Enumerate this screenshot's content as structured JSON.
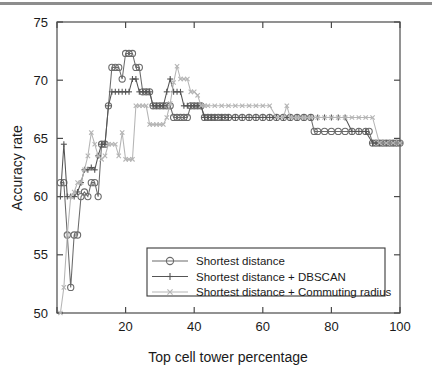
{
  "figure": {
    "background_color": "#ffffff",
    "top_rule_color": "#8d8d8d",
    "axis_color": "#4a4a4a"
  },
  "chart_data": {
    "type": "line",
    "title": "",
    "subtitle": "",
    "xlabel": "Top cell tower percentage",
    "ylabel": "Accuracy rate",
    "xlim": [
      0,
      100
    ],
    "ylim": [
      50,
      75
    ],
    "xticks": [
      0,
      20,
      40,
      60,
      80,
      100
    ],
    "xtick_labels": [
      "",
      "20",
      "40",
      "60",
      "80",
      "100"
    ],
    "yticks": [
      50,
      55,
      60,
      65,
      70,
      75
    ],
    "ytick_labels": [
      "50",
      "55",
      "60",
      "65",
      "70",
      "75"
    ],
    "grid": false,
    "legend_position": "lower center",
    "series": [
      {
        "name": "Shortest distance",
        "marker": "circle",
        "color": "#6b6b6b",
        "x": [
          1,
          2,
          3,
          4,
          5,
          6,
          7,
          8,
          9,
          10,
          11,
          12,
          13,
          14,
          15,
          16,
          17,
          18,
          19,
          20,
          21,
          22,
          23,
          24,
          25,
          26,
          27,
          28,
          29,
          30,
          31,
          32,
          33,
          34,
          35,
          36,
          37,
          38,
          39,
          40,
          41,
          42,
          43,
          44,
          45,
          46,
          47,
          48,
          49,
          50,
          52,
          54,
          56,
          58,
          60,
          62,
          64,
          66,
          68,
          70,
          72,
          74,
          75,
          76,
          78,
          80,
          82,
          84,
          86,
          88,
          90,
          91,
          92,
          93,
          94,
          95,
          96,
          97,
          98,
          99,
          100
        ],
        "y": [
          61.2,
          61.2,
          56.7,
          52.2,
          56.7,
          56.7,
          60.0,
          60.4,
          60.0,
          61.2,
          61.2,
          60.0,
          64.5,
          64.5,
          67.8,
          71.1,
          71.1,
          71.1,
          70.1,
          72.3,
          72.3,
          72.3,
          71.1,
          71.1,
          69.0,
          69.0,
          69.0,
          67.8,
          67.8,
          67.8,
          67.8,
          67.8,
          67.8,
          66.8,
          66.8,
          66.8,
          66.8,
          66.8,
          67.8,
          67.8,
          67.8,
          67.8,
          66.8,
          66.8,
          66.8,
          66.8,
          66.8,
          66.8,
          66.8,
          66.8,
          66.8,
          66.8,
          66.8,
          66.8,
          66.8,
          66.8,
          66.8,
          66.8,
          66.8,
          66.8,
          66.8,
          66.8,
          65.6,
          65.6,
          65.6,
          65.6,
          65.6,
          65.6,
          65.6,
          65.6,
          65.6,
          65.6,
          64.6,
          64.6,
          64.6,
          64.6,
          64.6,
          64.6,
          64.6,
          64.6,
          64.6
        ]
      },
      {
        "name": "Shortest distance + DBSCAN",
        "marker": "plus",
        "color": "#555555",
        "x": [
          1,
          2,
          3,
          4,
          5,
          6,
          7,
          8,
          9,
          10,
          11,
          12,
          13,
          14,
          15,
          16,
          17,
          18,
          19,
          20,
          21,
          22,
          23,
          24,
          25,
          26,
          27,
          28,
          29,
          30,
          31,
          32,
          33,
          34,
          35,
          36,
          37,
          38,
          39,
          40,
          41,
          42,
          43,
          44,
          45,
          46,
          48,
          50,
          52,
          54,
          56,
          58,
          60,
          62,
          64,
          66,
          68,
          70,
          72,
          74,
          76,
          78,
          80,
          82,
          84,
          86,
          88,
          90,
          92,
          94,
          96,
          98,
          100
        ],
        "y": [
          60.0,
          64.5,
          60.0,
          60.0,
          60.0,
          60.4,
          61.2,
          62.3,
          62.3,
          62.5,
          62.3,
          63.5,
          64.5,
          64.5,
          67.8,
          69.0,
          69.0,
          69.0,
          69.0,
          69.0,
          69.0,
          70.1,
          70.1,
          69.0,
          69.0,
          69.0,
          69.0,
          67.8,
          67.8,
          67.8,
          67.8,
          69.0,
          70.1,
          69.0,
          69.0,
          69.0,
          67.8,
          67.8,
          67.8,
          67.8,
          67.8,
          67.8,
          66.8,
          66.8,
          66.8,
          66.8,
          66.8,
          66.8,
          66.8,
          66.8,
          66.8,
          66.8,
          66.8,
          66.8,
          66.8,
          66.8,
          66.8,
          66.8,
          66.8,
          66.8,
          66.8,
          66.8,
          66.8,
          66.8,
          66.8,
          65.6,
          65.6,
          65.6,
          64.6,
          64.6,
          64.6,
          64.6,
          64.6
        ]
      },
      {
        "name": "Shortest distance + Commuting radius",
        "marker": "x",
        "color": "#b5b5b5",
        "x": [
          1,
          2,
          3,
          4,
          5,
          6,
          7,
          8,
          9,
          10,
          11,
          12,
          13,
          14,
          15,
          16,
          17,
          18,
          19,
          20,
          21,
          22,
          23,
          24,
          25,
          26,
          27,
          28,
          29,
          30,
          31,
          32,
          33,
          34,
          35,
          36,
          37,
          38,
          39,
          40,
          41,
          42,
          43,
          44,
          46,
          48,
          50,
          52,
          54,
          56,
          58,
          60,
          62,
          64,
          66,
          67,
          68,
          70,
          72,
          74,
          76,
          78,
          80,
          82,
          84,
          86,
          88,
          90,
          92,
          94,
          96,
          98,
          100
        ],
        "y": [
          50.0,
          52.2,
          56.7,
          60.0,
          60.4,
          61.2,
          61.2,
          62.3,
          63.5,
          65.5,
          64.5,
          63.5,
          63.2,
          63.5,
          64.5,
          64.5,
          64.5,
          63.5,
          65.5,
          63.2,
          63.2,
          63.2,
          67.8,
          67.8,
          67.8,
          67.8,
          66.2,
          66.2,
          66.2,
          66.2,
          66.2,
          66.8,
          68.0,
          69.8,
          71.2,
          70.1,
          70.1,
          70.1,
          69.0,
          69.0,
          68.7,
          67.8,
          67.8,
          67.8,
          67.8,
          67.8,
          67.8,
          67.8,
          67.8,
          67.8,
          67.8,
          67.8,
          67.8,
          66.8,
          66.8,
          67.8,
          66.8,
          66.8,
          66.8,
          66.8,
          66.8,
          66.8,
          66.8,
          66.8,
          66.8,
          66.8,
          66.8,
          66.8,
          66.8,
          64.6,
          64.6,
          64.6,
          64.6
        ]
      }
    ]
  }
}
